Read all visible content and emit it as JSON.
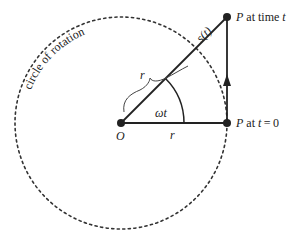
{
  "diagram": {
    "labels": {
      "circle": "circle of rotation",
      "origin": "O",
      "p_at_time_t_P": "P",
      "p_at_time_t_rest": " at time ",
      "p_at_time_t_var": "t",
      "p_at_zero_P": "P",
      "p_at_zero_rest": " at ",
      "p_at_zero_var": "t",
      "p_at_zero_eq": " = 0",
      "radius_bottom": "r",
      "radius_brace": "r",
      "angle": "ωt",
      "arc_length": "s(t)"
    },
    "geometry": {
      "center": [
        121,
        123
      ],
      "radius": 106,
      "p_time_t": [
        227,
        17
      ],
      "p_time_zero": [
        227,
        123
      ]
    },
    "colors": {
      "stroke": "#222222",
      "background": "#ffffff"
    }
  }
}
